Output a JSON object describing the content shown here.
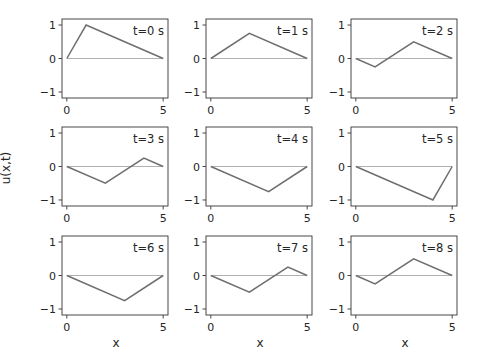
{
  "figure": {
    "ylabel": "u(x,t)",
    "xlabel": "x"
  },
  "style": {
    "line_color": "#6e6e6e",
    "zero_line_color": "#b0b0b0",
    "axes_color": "#333333",
    "text_color": "#262626"
  },
  "chart_data": {
    "type": "line",
    "title": "",
    "xlabel": "x",
    "ylabel": "u(x,t)",
    "xlim": [
      -0.25,
      5.25
    ],
    "ylim": [
      -1.18,
      1.18
    ],
    "xticks": [
      0,
      5
    ],
    "yticks": [
      -1,
      0,
      1
    ],
    "grid": false,
    "legend": "none",
    "layout": "3x3 subplots",
    "subplots": [
      {
        "label": "t=0 s",
        "x": [
          0,
          1,
          5
        ],
        "u": [
          0,
          1,
          0
        ],
        "zero_line": [
          [
            0,
            5
          ],
          [
            0,
            0
          ]
        ]
      },
      {
        "label": "t=1 s",
        "x": [
          0,
          2,
          5
        ],
        "u": [
          0,
          0.75,
          0
        ],
        "zero_line": [
          [
            0,
            5
          ],
          [
            0,
            0
          ]
        ]
      },
      {
        "label": "t=2 s",
        "x": [
          0,
          1,
          3,
          5
        ],
        "u": [
          0,
          -0.25,
          0.5,
          0
        ],
        "zero_line": [
          [
            0,
            5
          ],
          [
            0,
            0
          ]
        ]
      },
      {
        "label": "t=3 s",
        "x": [
          0,
          2,
          4,
          5
        ],
        "u": [
          0,
          -0.5,
          0.25,
          0
        ],
        "zero_line": [
          [
            0,
            5
          ],
          [
            0,
            0
          ]
        ]
      },
      {
        "label": "t=4 s",
        "x": [
          0,
          3,
          5
        ],
        "u": [
          0,
          -0.75,
          0
        ],
        "zero_line": [
          [
            0,
            5
          ],
          [
            0,
            0
          ]
        ]
      },
      {
        "label": "t=5 s",
        "x": [
          0,
          4,
          5
        ],
        "u": [
          0,
          -1,
          0
        ],
        "zero_line": [
          [
            0,
            5
          ],
          [
            0,
            0
          ]
        ]
      },
      {
        "label": "t=6 s",
        "x": [
          0,
          3,
          5
        ],
        "u": [
          0,
          -0.75,
          0
        ],
        "zero_line": [
          [
            0,
            5
          ],
          [
            0,
            0
          ]
        ]
      },
      {
        "label": "t=7 s",
        "x": [
          0,
          2,
          4,
          5
        ],
        "u": [
          0,
          -0.5,
          0.25,
          0
        ],
        "zero_line": [
          [
            0,
            5
          ],
          [
            0,
            0
          ]
        ]
      },
      {
        "label": "t=8 s",
        "x": [
          0,
          1,
          3,
          5
        ],
        "u": [
          0,
          -0.25,
          0.5,
          0
        ],
        "zero_line": [
          [
            0,
            5
          ],
          [
            0,
            0
          ]
        ]
      }
    ]
  }
}
